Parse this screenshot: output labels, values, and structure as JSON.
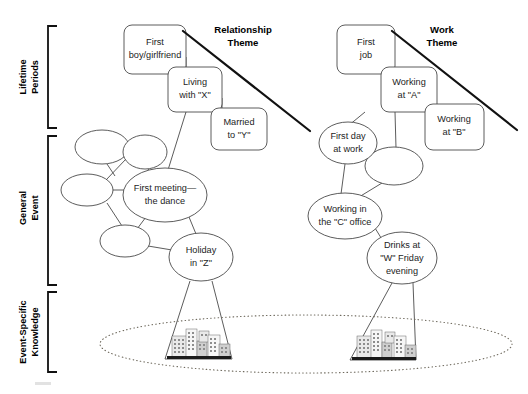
{
  "figure": {
    "axis_labels": [
      {
        "id": "lifetime-periods",
        "label_line1": "Lifetime",
        "label_line2": "Periods"
      },
      {
        "id": "general-event",
        "label_line1": "General",
        "label_line2": "Event"
      },
      {
        "id": "event-specific-knowledge",
        "label_line1": "Event-Specific",
        "label_line2": "Knowledge"
      }
    ],
    "themes": [
      {
        "id": "relationship-theme",
        "line1": "Relationship",
        "line2": "Theme",
        "x": 243,
        "y": 26
      },
      {
        "id": "work-theme",
        "line1": "Work",
        "line2": "Theme",
        "x": 442,
        "y": 26
      }
    ],
    "lifetime_period_boxes": [
      {
        "id": "first-boy-girlfriend",
        "line1": "First",
        "line2": "boy/girlfriend",
        "x": 124,
        "y": 25,
        "w": 62,
        "h": 49
      },
      {
        "id": "living-with-x",
        "line1": "Living",
        "line2": "with \"X\"",
        "x": 168,
        "y": 67,
        "w": 54,
        "h": 45
      },
      {
        "id": "married-to-y",
        "line1": "Married",
        "line2": "to \"Y\"",
        "x": 211,
        "y": 108,
        "w": 56,
        "h": 42
      },
      {
        "id": "first-job",
        "line1": "First",
        "line2": "job",
        "x": 337,
        "y": 25,
        "w": 58,
        "h": 49
      },
      {
        "id": "working-at-a",
        "line1": "Working",
        "line2": "at \"A\"",
        "x": 381,
        "y": 67,
        "w": 56,
        "h": 45
      },
      {
        "id": "working-at-b",
        "line1": "Working",
        "line2": "at \"B\"",
        "x": 425,
        "y": 104,
        "w": 59,
        "h": 46
      }
    ],
    "general_event_ellipses": [
      {
        "id": "unlabeled-ge-1",
        "line1": "",
        "line2": "",
        "cx": 102,
        "cy": 147,
        "rx": 27,
        "ry": 17
      },
      {
        "id": "unlabeled-ge-2",
        "line1": "",
        "line2": "",
        "cx": 145,
        "cy": 152,
        "rx": 22,
        "ry": 17
      },
      {
        "id": "unlabeled-ge-3",
        "line1": "",
        "line2": "",
        "cx": 87,
        "cy": 190,
        "rx": 26,
        "ry": 16
      },
      {
        "id": "first-meeting-the-dance",
        "line1": "First meeting—",
        "line2": "the dance",
        "cx": 165,
        "cy": 195,
        "rx": 42,
        "ry": 27
      },
      {
        "id": "unlabeled-ge-4",
        "line1": "",
        "line2": "",
        "cx": 125,
        "cy": 241,
        "rx": 25,
        "ry": 16
      },
      {
        "id": "holiday-in-z",
        "line1": "Holiday",
        "line2": "in \"Z\"",
        "cx": 201,
        "cy": 257,
        "rx": 32,
        "ry": 24
      },
      {
        "id": "first-day-at-work",
        "line1": "First day",
        "line2": "at work",
        "cx": 348,
        "cy": 143,
        "rx": 29,
        "ry": 21
      },
      {
        "id": "unlabeled-ge-5",
        "line1": "",
        "line2": "",
        "cx": 394,
        "cy": 166,
        "rx": 29,
        "ry": 19
      },
      {
        "id": "working-in-the-c-office",
        "line1": "Working in",
        "line2": "the \"C\" office",
        "cx": 345,
        "cy": 216,
        "rx": 37,
        "ry": 23
      },
      {
        "id": "drinks-at-w-friday-evening",
        "line1": "Drinks at",
        "line2": "\"W\" Friday",
        "line3": "evening",
        "cx": 402,
        "cy": 258,
        "rx": 35,
        "ry": 26
      }
    ],
    "event_specific_scenes": [
      {
        "id": "esk-scene-left",
        "icon": "cityscape-icon",
        "cx": 198,
        "cy": 345
      },
      {
        "id": "esk-scene-right",
        "icon": "cityscape-icon",
        "cx": 382,
        "cy": 345
      }
    ],
    "esk_boundary": {
      "id": "esk-dotted-ellipse",
      "cx": 306,
      "cy": 344,
      "rx": 206,
      "ry": 29
    },
    "colors": {
      "stroke": "#4a4a4a",
      "theme_line": "#111111",
      "text": "#1d1d1d",
      "dotted": "#6f6a5e",
      "background": "#ffffff"
    }
  }
}
